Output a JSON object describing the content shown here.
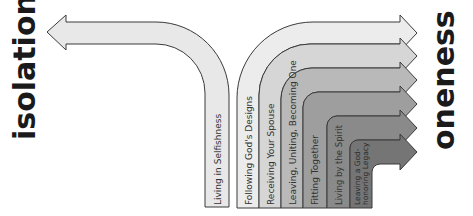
{
  "diagram": {
    "left_label": "isolation",
    "right_label": "oneness",
    "left_path": {
      "label": "Living in Selfishness",
      "direction": "left",
      "fill": "#e8e8e8"
    },
    "right_paths": [
      {
        "label": "Following God's Designs",
        "fill": "#ececec"
      },
      {
        "label": "Receiving Your Spouse",
        "fill": "#d6d6d6"
      },
      {
        "label": "Leaving, Uniting, Becoming One",
        "fill": "#b9b9b9"
      },
      {
        "label": "Fitting Together",
        "fill": "#9e9e9e"
      },
      {
        "label": "Living by the Spirit",
        "fill": "#8a8a8a"
      },
      {
        "label": "Leaving a God-honoring Legacy",
        "fill": "#757575",
        "lines": [
          "Leaving a God-",
          "honoring Legacy"
        ]
      }
    ],
    "stroke_color": "#333333",
    "text_color": "#333333"
  }
}
